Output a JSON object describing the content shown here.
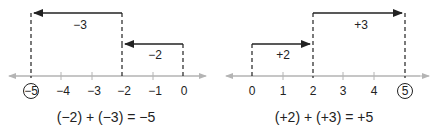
{
  "left": {
    "ticks": [
      "−5",
      "−4",
      "−3",
      "−2",
      "−1",
      "0"
    ],
    "circled": "−5",
    "arrow1_label": "−2",
    "arrow2_label": "−3",
    "equation": "(−2) + (−3) = −5"
  },
  "right": {
    "ticks": [
      "0",
      "1",
      "2",
      "3",
      "4",
      "5"
    ],
    "circled": "5",
    "arrow1_label": "+2",
    "arrow2_label": "+3",
    "equation": "(+2) + (+3) = +5"
  },
  "colors": {
    "axis": "#b4b4b4",
    "ink": "#222222"
  }
}
